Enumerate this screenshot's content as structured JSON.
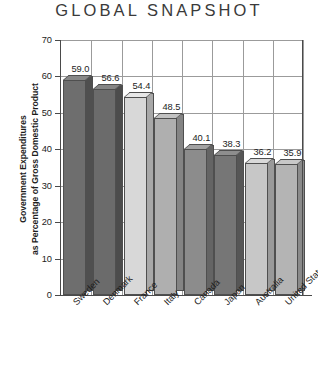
{
  "chart_data": {
    "type": "bar",
    "title": "GLOBAL SNAPSHOT",
    "xlabel": "",
    "ylabel": "Government Expenditures as Percentage of Gross Domestic Product",
    "ylabel_lines": [
      "Government Expenditures",
      "as Percentage of Gross Domestic Product"
    ],
    "categories": [
      "Sweden",
      "Denmark",
      "France",
      "Italy",
      "Canada",
      "Japan",
      "Australia",
      "United States"
    ],
    "values": [
      59.0,
      56.6,
      54.4,
      48.5,
      40.1,
      38.3,
      36.2,
      35.9
    ],
    "value_labels": [
      "59.0",
      "56.6",
      "54.4",
      "48.5",
      "40.1",
      "38.3",
      "36.2",
      "35.9"
    ],
    "ylim": [
      0,
      70
    ],
    "yticks": [
      0,
      10,
      20,
      30,
      40,
      50,
      60,
      70
    ],
    "ytick_labels": [
      "0",
      "10",
      "20",
      "30",
      "40",
      "50",
      "60",
      "70"
    ],
    "grid": true,
    "legend": false,
    "bar_colors": [
      "#6e6e6e",
      "#6b6b6b",
      "#d8d8d8",
      "#afafaf",
      "#8c8c8c",
      "#767676",
      "#c7c7c7",
      "#b4b4b4"
    ],
    "bar_side_colors": [
      "#4f4f4f",
      "#4c4c4c",
      "#a8a8a8",
      "#848484",
      "#646464",
      "#565656",
      "#999999",
      "#8a8a8a"
    ],
    "bar_top_colors": [
      "#888888",
      "#858585",
      "#e8e8e8",
      "#c2c2c2",
      "#a2a2a2",
      "#8e8e8e",
      "#d9d9d9",
      "#c8c8c8"
    ],
    "axis_color": "#4a4a4a",
    "grid_color": "#9b9b9b",
    "background": "#ffffff"
  }
}
